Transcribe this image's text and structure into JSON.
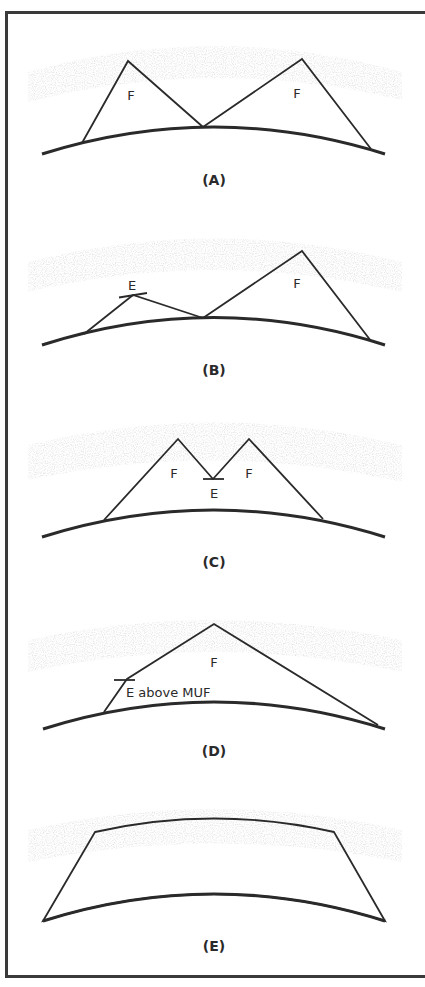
{
  "figure": {
    "colors": {
      "line": "#2a2a2a",
      "ground": "#2a2a2a",
      "stipple": "#c8c8c8",
      "frame": "#3a3a3a",
      "background": "#ffffff"
    },
    "panels": [
      {
        "id": "A",
        "caption": "(A)",
        "labels": [
          "F",
          "F"
        ]
      },
      {
        "id": "B",
        "caption": "(B)",
        "labels": [
          "E",
          "F"
        ]
      },
      {
        "id": "C",
        "caption": "(C)",
        "labels": [
          "F",
          "F",
          "E"
        ]
      },
      {
        "id": "D",
        "caption": "(D)",
        "labels": [
          "F",
          "E above MUF"
        ]
      },
      {
        "id": "E",
        "caption": "(E)",
        "labels": []
      }
    ]
  }
}
